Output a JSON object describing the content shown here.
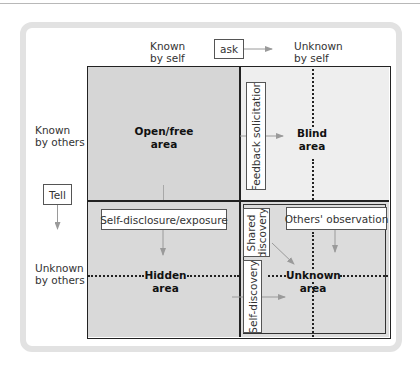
{
  "diagram": {
    "columns": {
      "left": "Known\nby self",
      "left_line1": "Known",
      "left_line2": "by self",
      "right_line1": "Unknown",
      "right_line2": "by self"
    },
    "rows": {
      "top_line1": "Known",
      "top_line2": "by others",
      "bottom_line1": "Unknown",
      "bottom_line2": "by others"
    },
    "actions": {
      "ask": "ask",
      "tell": "Tell",
      "feedback": "Feedback solicitation",
      "self_disclosure": "Self-disclosure/exposure",
      "others_observation": "Others' observation",
      "shared_discovery_line1": "Shared",
      "shared_discovery_line2": "discovery",
      "self_discovery": "Self-discovery"
    },
    "quadrants": {
      "open": {
        "line1": "Open/free",
        "line2": "area"
      },
      "blind": {
        "line1": "Blind",
        "line2": "area"
      },
      "hidden": {
        "line1": "Hidden",
        "line2": "area"
      },
      "unknown": {
        "line1": "Unknown",
        "line2": "area"
      }
    },
    "colors": {
      "open": "#d6d6d6",
      "blind": "#eeeeee",
      "hidden": "#d9d9d9",
      "unknown": "#dcdcdc",
      "border": "#222222",
      "arrow": "#9a9a9a",
      "card_border": "#e2e2e2"
    }
  }
}
